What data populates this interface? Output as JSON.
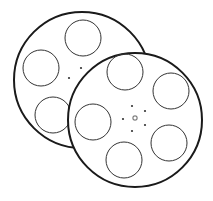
{
  "illustration": {
    "subject": "film-reels",
    "stroke_color": "#1a1a1a",
    "fill_color": "#ffffff",
    "reels": [
      {
        "name": "back-reel",
        "cx": 82,
        "cy": 80,
        "r": 68,
        "holes": [
          {
            "cx": 83,
            "cy": 38,
            "r": 18
          },
          {
            "cx": 41,
            "cy": 68,
            "r": 18
          },
          {
            "cx": 53,
            "cy": 115,
            "r": 18
          }
        ],
        "dots": [
          {
            "cx": 81,
            "cy": 68
          },
          {
            "cx": 69,
            "cy": 78
          }
        ]
      },
      {
        "name": "front-reel",
        "cx": 135,
        "cy": 120,
        "r": 67,
        "holes": [
          {
            "cx": 125,
            "cy": 72,
            "r": 18
          },
          {
            "cx": 171,
            "cy": 91,
            "r": 18
          },
          {
            "cx": 93,
            "cy": 122,
            "r": 18
          },
          {
            "cx": 169,
            "cy": 143,
            "r": 18
          },
          {
            "cx": 124,
            "cy": 160,
            "r": 18
          }
        ],
        "dots": [
          {
            "cx": 132,
            "cy": 106
          },
          {
            "cx": 145,
            "cy": 111
          },
          {
            "cx": 123,
            "cy": 119
          },
          {
            "cx": 145,
            "cy": 125
          },
          {
            "cx": 132,
            "cy": 131
          }
        ],
        "hub": {
          "cx": 135,
          "cy": 118
        }
      }
    ]
  }
}
